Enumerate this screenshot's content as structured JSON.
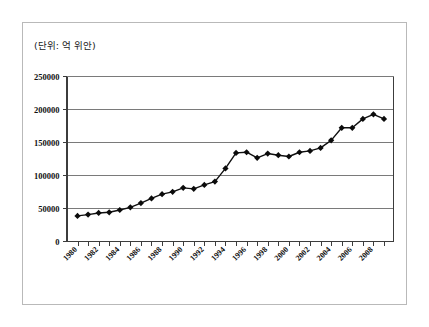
{
  "figure": {
    "unit_caption": "(단위: 억 위안)",
    "background_color": "#ffffff",
    "frame_border_color": "#b9b9b9"
  },
  "chart_data": {
    "type": "line",
    "title": "",
    "subtitle": "",
    "xlabel": "",
    "ylabel": "",
    "unit_note": "(단위: 억 위안)",
    "grid": true,
    "legend": "none",
    "marker": "filled-diamond",
    "line_color": "#101010",
    "marker_color": "#0b0b0b",
    "ylim": [
      0,
      250000
    ],
    "ytick_labels": [
      "0",
      "50000",
      "100000",
      "150000",
      "200000",
      "250000"
    ],
    "ytick_values": [
      0,
      50000,
      100000,
      150000,
      200000,
      250000
    ],
    "xtick_labels": [
      "1980",
      "1982",
      "1984",
      "1986",
      "1988",
      "1990",
      "1992",
      "1994",
      "1996",
      "1998",
      "2000",
      "2002",
      "2004",
      "2006",
      "2008"
    ],
    "xtick_label_rotation": -45,
    "x": [
      1980,
      1981,
      1982,
      1983,
      1984,
      1985,
      1986,
      1987,
      1988,
      1989,
      1990,
      1991,
      1992,
      1993,
      1994,
      1995,
      1996,
      1997,
      1998,
      1999,
      2000,
      2001,
      2002,
      2003,
      2004,
      2005,
      2006,
      2007,
      2008,
      2009
    ],
    "values": [
      38000,
      40000,
      42500,
      43500,
      47000,
      51000,
      57500,
      64500,
      71000,
      74500,
      80500,
      79000,
      85000,
      90000,
      110000,
      133500,
      134500,
      126000,
      132500,
      130000,
      128000,
      134500,
      136500,
      141000,
      152500,
      171500,
      171500,
      185000,
      192000,
      185000
    ],
    "series": [
      {
        "name": "value",
        "values": [
          38000,
          40000,
          42500,
          43500,
          47000,
          51000,
          57500,
          64500,
          71000,
          74500,
          80500,
          79000,
          85000,
          90000,
          110000,
          133500,
          134500,
          126000,
          132500,
          130000,
          128000,
          134500,
          136500,
          141000,
          152500,
          171500,
          171500,
          185000,
          192000,
          185000
        ]
      }
    ]
  }
}
